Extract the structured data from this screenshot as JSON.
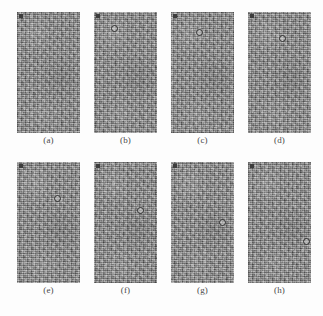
{
  "figure": {
    "background_color": "#fdfdfd",
    "panel_base_color": "#8b8b8b",
    "marker_color": "#2e2e2e",
    "rows": 2,
    "columns": 4,
    "panel_width_px": 63,
    "panel_height_px": 121
  },
  "panels": [
    {
      "id": "a",
      "caption": "(a)",
      "row": 0,
      "column": 0,
      "corner_marker": true,
      "target_circle": null
    },
    {
      "id": "b",
      "caption": "(b)",
      "row": 0,
      "column": 1,
      "corner_marker": true,
      "target_circle": {
        "x_pct": 27,
        "y_pct": 11
      }
    },
    {
      "id": "c",
      "caption": "(c)",
      "row": 0,
      "column": 2,
      "corner_marker": true,
      "target_circle": {
        "x_pct": 39,
        "y_pct": 14
      }
    },
    {
      "id": "d",
      "caption": "(d)",
      "row": 0,
      "column": 3,
      "corner_marker": true,
      "target_circle": {
        "x_pct": 49,
        "y_pct": 19
      }
    },
    {
      "id": "e",
      "caption": "(e)",
      "row": 1,
      "column": 0,
      "corner_marker": true,
      "target_circle": {
        "x_pct": 58,
        "y_pct": 27
      }
    },
    {
      "id": "f",
      "caption": "(f)",
      "row": 1,
      "column": 1,
      "corner_marker": true,
      "target_circle": {
        "x_pct": 68,
        "y_pct": 37
      }
    },
    {
      "id": "g",
      "caption": "(g)",
      "row": 1,
      "column": 2,
      "corner_marker": true,
      "target_circle": {
        "x_pct": 76,
        "y_pct": 47
      }
    },
    {
      "id": "h",
      "caption": "(h)",
      "row": 1,
      "column": 3,
      "corner_marker": true,
      "target_circle": {
        "x_pct": 87,
        "y_pct": 63
      }
    }
  ]
}
